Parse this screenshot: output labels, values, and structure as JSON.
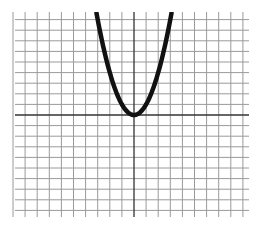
{
  "chart_data": {
    "type": "line",
    "title": "",
    "xlabel": "",
    "ylabel": "",
    "function": "y = x^2",
    "series": [
      {
        "name": "parabola",
        "color": "#111111",
        "x": [
          -3.1,
          -3,
          -2.5,
          -2,
          -1.5,
          -1,
          -0.5,
          0,
          0.5,
          1,
          1.5,
          2,
          2.5,
          3,
          3.1
        ],
        "y": [
          9.61,
          9,
          6.25,
          4,
          2.25,
          1,
          0.25,
          0,
          0.25,
          1,
          2.25,
          4,
          6.25,
          9,
          9.61
        ]
      }
    ],
    "xlim": [
      -10,
      9.5
    ],
    "ylim": [
      -9.6,
      9.6
    ],
    "grid": true,
    "grid_step": 1,
    "axes_visible": true,
    "tick_labels": false,
    "legend": null
  },
  "layout": {
    "origin_px": [
      134,
      115
    ],
    "unit_px_x": 12.1,
    "unit_px_y": 10.6,
    "grid_x_px": [
      15,
      249
    ],
    "grid_y_px": [
      12,
      217
    ],
    "h_lines_units": [
      -9,
      -8,
      -7,
      -6,
      -5,
      -4,
      -3,
      -2,
      -1,
      1,
      2,
      3,
      4,
      5,
      6,
      7,
      8,
      9
    ],
    "v_lines_units": [
      -10,
      -9,
      -8,
      -7,
      -6,
      -5,
      -4,
      -3,
      -2,
      -1,
      1,
      2,
      3,
      4,
      5,
      6,
      7,
      8,
      9
    ],
    "colors": {
      "grid": "#9a9a9a",
      "axis": "#333333",
      "curve": "#111111",
      "background": "#ffffff"
    }
  }
}
